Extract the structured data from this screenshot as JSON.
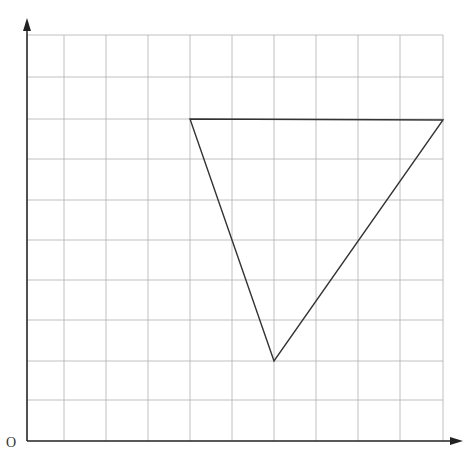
{
  "diagram": {
    "type": "grid-triangle",
    "origin_label": "O",
    "grid": {
      "x_lines": [
        27,
        64,
        106,
        148,
        190,
        232,
        274,
        316,
        358,
        400,
        443
      ],
      "y_lines": [
        35,
        77,
        119,
        159,
        200,
        240,
        280,
        320,
        361,
        400
      ],
      "color": "#b0b0b0"
    },
    "axes": {
      "origin": [
        27,
        441
      ],
      "x_end": [
        463,
        441
      ],
      "y_end": [
        27,
        18
      ],
      "color": "#222222"
    },
    "triangle": {
      "vertices": [
        [
          190,
          119
        ],
        [
          443,
          120
        ],
        [
          274,
          361
        ]
      ],
      "grid_coords": [
        [
          4,
          8
        ],
        [
          10,
          8
        ],
        [
          6,
          2
        ]
      ],
      "color": "#333333"
    }
  }
}
